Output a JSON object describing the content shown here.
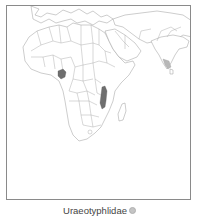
{
  "map": {
    "region": "Africa, Middle East and South Asia",
    "frame_color": "#8a8a8a",
    "land_fill": "#ffffff",
    "border_color": "#a0a0a0",
    "ranges": [
      {
        "name": "Cameroon highlands",
        "shade": "dark",
        "color": "#6e6e6e"
      },
      {
        "name": "East African / Malawi corridor",
        "shade": "dark",
        "color": "#6e6e6e"
      },
      {
        "name": "Southwestern India (Western Ghats)",
        "shade": "light",
        "color": "#b8b8b8"
      }
    ]
  },
  "caption": {
    "label": "Uraeotyphlidae",
    "legend_color": "#c4c4c4",
    "legend_icon": "circle-swatch"
  }
}
